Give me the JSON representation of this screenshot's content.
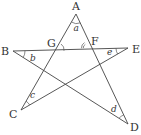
{
  "diagram": {
    "type": "five-pointed star (pentagram) geometry figure",
    "points": {
      "A": {
        "label": "A",
        "x": 76,
        "y": 14
      },
      "B": {
        "label": "B",
        "x": 13,
        "y": 51
      },
      "C": {
        "label": "C",
        "x": 21,
        "y": 110
      },
      "D": {
        "label": "D",
        "x": 128,
        "y": 124
      },
      "E": {
        "label": "E",
        "x": 128,
        "y": 48
      },
      "F": {
        "label": "F",
        "x": 87,
        "y": 48
      },
      "G": {
        "label": "G",
        "x": 57,
        "y": 51
      }
    },
    "segments": [
      "AC",
      "AD",
      "BE",
      "BD",
      "CE"
    ],
    "angle_labels": {
      "a": "a",
      "b": "b",
      "c": "c",
      "d": "d",
      "e": "e"
    },
    "colors": {
      "line": "#444444",
      "text": "#333333",
      "background": "#ffffff"
    }
  }
}
